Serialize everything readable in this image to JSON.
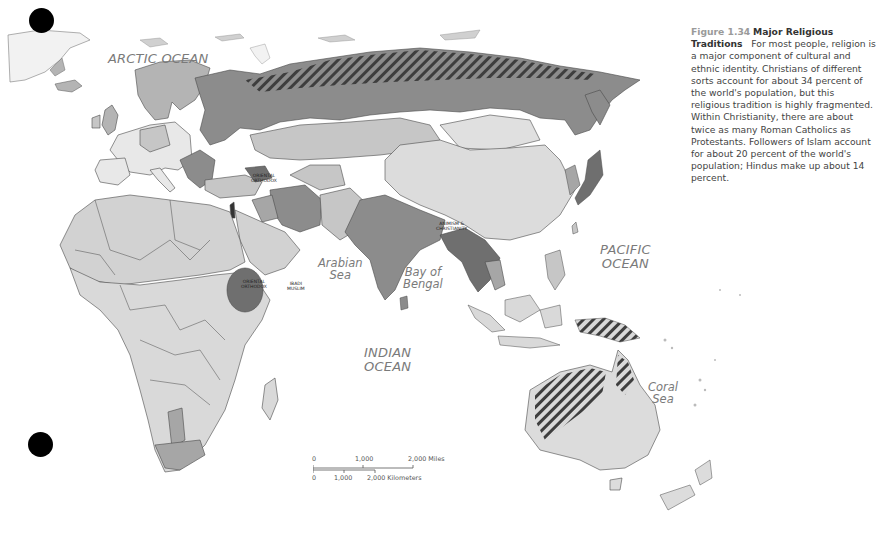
{
  "caption": {
    "figure_number": "Figure 1.34",
    "figure_title": "Major Religious Traditions",
    "body": "For most people, religion is a major component of cultural and ethnic identity. Christians of different sorts account for about 34 percent of the world's population, but this religious tradition is highly fragmented. Within Christianity, there are about twice as many Roman Catholics as Protestants. Followers of Islam account for about 20 percent of the world's population; Hindus make up about 14 percent."
  },
  "water_labels": {
    "arctic": "ARCTIC OCEAN",
    "arabian_1": "Arabian",
    "arabian_2": "Sea",
    "bengal_1": "Bay of",
    "bengal_2": "Bengal",
    "indian_1": "INDIAN",
    "indian_2": "OCEAN",
    "pacific_1": "PACIFIC",
    "pacific_2": "OCEAN",
    "coral_1": "Coral",
    "coral_2": "Sea"
  },
  "region_labels": {
    "caucasus_1": "Oriental",
    "caucasus_2": "Orthodox",
    "ethiopia_1": "Oriental",
    "ethiopia_2": "Orthodox",
    "somalia_1": "Ibadi",
    "somalia_2": "Muslim",
    "myanmar_1": "Animism &",
    "myanmar_2": "Christianity"
  },
  "scale_bar": {
    "miles": [
      "0",
      "1,000",
      "2,000 Miles"
    ],
    "kilometers": [
      "0",
      "1,000",
      "2,000 Kilometers"
    ]
  },
  "colors": {
    "land_light": "#d9d9d9",
    "land_mid": "#b4b4b4",
    "land_dark": "#8c8c8c",
    "land_darker": "#6f6f6f",
    "border": "#4a4a4a",
    "water": "#ffffff",
    "ocean_label": "#7a7a7a"
  },
  "markers": [
    {
      "x": 15,
      "y": 8
    },
    {
      "x": 28,
      "y": 432
    }
  ]
}
